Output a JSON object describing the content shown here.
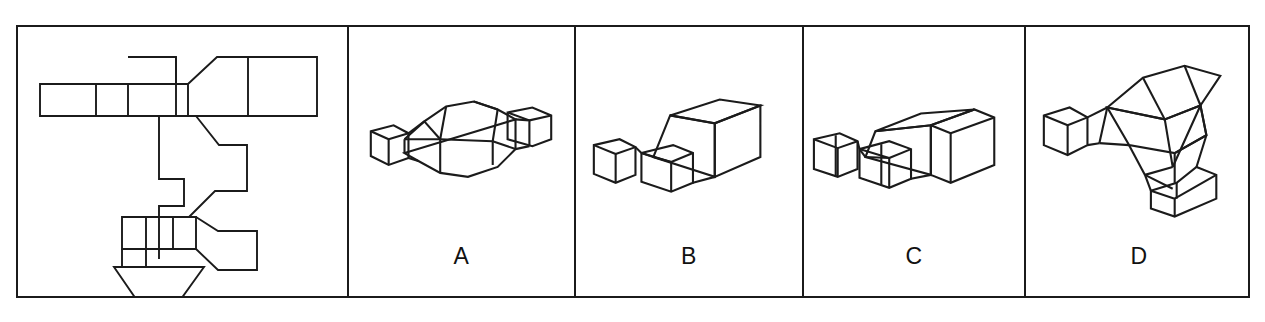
{
  "item": {
    "type": "spatial-reasoning-net-matching",
    "stimulus_panel_label": "",
    "answer_labels": [
      "A",
      "B",
      "C",
      "D"
    ]
  },
  "colors": {
    "line": "#1b1b1b",
    "background": "#ffffff",
    "text": "#111111"
  },
  "frame": {
    "x": 16,
    "y": 25,
    "width": 1234,
    "height": 273,
    "border_px": 2
  },
  "panels": [
    {
      "name": "net-panel",
      "label": "",
      "left": 0,
      "width": 329,
      "content": "unfolded-net"
    },
    {
      "name": "option-panel-a",
      "label": "A",
      "left": 329,
      "width": 227,
      "content": "3d-solid-a"
    },
    {
      "name": "option-panel-b",
      "label": "B",
      "left": 556,
      "width": 228,
      "content": "3d-solid-b"
    },
    {
      "name": "option-panel-c",
      "label": "C",
      "left": 784,
      "width": 222,
      "content": "3d-solid-c"
    },
    {
      "name": "option-panel-d",
      "label": "D",
      "left": 1006,
      "width": 228,
      "content": "3d-solid-d"
    }
  ],
  "shapes": {
    "net": {
      "description": "Unfolded planar net of a polyhedral solid: horizontal strip of rectangles at top with a square tab above, a tapered/trapezoid flare to the right ending in two long rectangles; a zig-zag hook outline in the middle; a lower horizontal strip of rectangles with a tapered flare to a square; and a trapezoid funnel with a rectangle below at bottom-left.",
      "paths": [
        "M22,80 L170,80 L170,112 L22,112 Z",
        "M78,80 L78,112",
        "M110,80 L110,112",
        "M110,53 L158,53 L158,112",
        "M110,53 L110,112",
        "M170,80 L198,53 L297,53 L297,112 L198,112 L170,112",
        "M228,53 L228,112",
        "M170,80 L170,112",
        "M141,112 L141,175 L165,175 L165,200 L141,200 L141,255",
        "M178,112 L200,140 L228,140 L228,185 L196,185 L170,212",
        "M104,212 L178,212 L178,244 L104,244 Z",
        "M128,212 L128,244",
        "M155,212 L155,244",
        "M178,212 L199,226 L238,226 L238,265 L199,265 L178,244",
        "M104,244 L104,262",
        "M128,244 L128,262",
        "M96,262 L185,262 L163,294 L118,294 Z",
        "M118,294 L118,318 L163,318 L163,294"
      ]
    },
    "solid_a": {
      "description": "Axonometric view of a symmetric faceted block: a central box with sloped hip-roof style faces flaring outward to two small cuboid stubs at left and right.",
      "view": "three-quarter, roughly symmetric silhouette"
    },
    "solid_b": {
      "description": "Axonometric view of a wedge-shaped block: a tall cuboid at the right with a single sloped face descending leftward to two small cuboid stubs in front.",
      "view": "three-quarter from front-left"
    },
    "solid_c": {
      "description": "Axonometric view similar to B but flatter: a cuboid at the right with a long shallow sloped top descending leftward to a row of small cuboid stubs.",
      "view": "three-quarter from front-left"
    },
    "solid_d": {
      "description": "Axonometric view of a faceted block with stubs pointing left and downward-right, sloped roof faces, seen from a rotated angle.",
      "view": "three-quarter rotated"
    }
  }
}
